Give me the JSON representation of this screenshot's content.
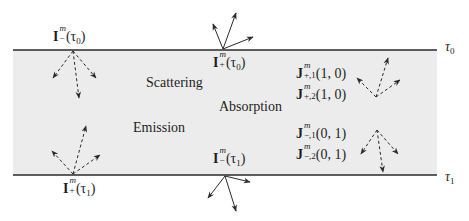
{
  "diagram": {
    "colors": {
      "slab_fill": "#ececec",
      "boundary_line": "#2a2a2a",
      "arrow": "#2a2a2a",
      "text": "#1e1e1e",
      "background": "#ffffff"
    },
    "slab": {
      "x": 13,
      "y": 50,
      "width": 424,
      "height": 125
    },
    "boundaries": {
      "top": {
        "y": 50,
        "x1": 13,
        "x2": 437,
        "label": "τ",
        "label_sub": "0"
      },
      "bottom": {
        "y": 175,
        "x1": 13,
        "x2": 437,
        "label": "τ",
        "label_sub": "1"
      }
    },
    "processes": {
      "scattering": "Scattering",
      "absorption": "Absorption",
      "emission": "Emission"
    },
    "intensities": {
      "top_left": {
        "base": "I",
        "sup": "m",
        "sub": "−",
        "arg": "(τ",
        "arg_sub": "0",
        "close": ")"
      },
      "top_center": {
        "base": "I",
        "sup": "m",
        "sub": "+",
        "arg": "(τ",
        "arg_sub": "0",
        "close": ")"
      },
      "bottom_center": {
        "base": "I",
        "sup": "m",
        "sub": "−",
        "arg": "(τ",
        "arg_sub": "1",
        "close": ")"
      },
      "bottom_left": {
        "base": "I",
        "sup": "m",
        "sub": "+",
        "arg": "(τ",
        "arg_sub": "1",
        "close": ")"
      }
    },
    "fluxes": [
      {
        "base": "J",
        "sup": "m",
        "sub": "+,1",
        "arg": "(1, 0)"
      },
      {
        "base": "J",
        "sup": "m",
        "sub": "+,2",
        "arg": "(1, 0)"
      },
      {
        "base": "J",
        "sup": "m",
        "sub": "−,1",
        "arg": "(0, 1)"
      },
      {
        "base": "J",
        "sup": "m",
        "sub": "−,2",
        "arg": "(0, 1)"
      }
    ],
    "arrow_groups": [
      {
        "name": "top-left-incoming",
        "style": "dashed",
        "origin": [
          73,
          51
        ],
        "heads": [
          [
            53,
            78
          ],
          [
            79,
            98
          ],
          [
            96,
            78
          ]
        ]
      },
      {
        "name": "top-center-outgoing",
        "style": "solid",
        "origin": [
          223,
          49
        ],
        "heads": [
          [
            213,
            24
          ],
          [
            236,
            13
          ],
          [
            253,
            37
          ]
        ]
      },
      {
        "name": "bottom-left-incoming",
        "style": "dashed",
        "origin": [
          73,
          174
        ],
        "heads": [
          [
            52,
            151
          ],
          [
            86,
            126
          ],
          [
            100,
            155
          ]
        ]
      },
      {
        "name": "bottom-center-outgoing",
        "style": "solid",
        "origin": [
          225,
          176
        ],
        "heads": [
          [
            208,
            198
          ],
          [
            236,
            211
          ],
          [
            250,
            182
          ]
        ]
      },
      {
        "name": "right-top-interior",
        "style": "dashed",
        "origin": [
          376,
          97
        ],
        "heads": [
          [
            357,
            78
          ],
          [
            388,
            58
          ],
          [
            400,
            80
          ]
        ]
      },
      {
        "name": "right-bottom-interior",
        "style": "dashed",
        "origin": [
          377,
          130
        ],
        "heads": [
          [
            361,
            154
          ],
          [
            383,
            172
          ],
          [
            398,
            154
          ]
        ]
      }
    ]
  }
}
